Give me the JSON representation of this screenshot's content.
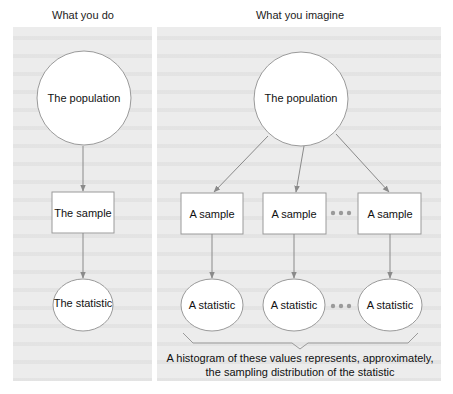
{
  "headings": {
    "left": "What you do",
    "right": "What you imagine"
  },
  "left_column": {
    "population": "The population",
    "sample": "The sample",
    "statistic": "The statistic"
  },
  "right_column": {
    "population": "The population",
    "samples": [
      "A sample",
      "A sample",
      "A sample"
    ],
    "statistics": [
      "A statistic",
      "A statistic",
      "A statistic"
    ],
    "ellipsis_icon": "ellipsis-dots"
  },
  "caption": {
    "line1": "A histogram of these values represents, approximately,",
    "line2": "the sampling distribution of the statistic"
  },
  "colors": {
    "background_page": "#ececec",
    "line": "#8a8a8a",
    "node_fill": "#ffffff",
    "node_stroke": "#9a9a9a",
    "dots": "#9a9a9a",
    "text": "#111111"
  }
}
